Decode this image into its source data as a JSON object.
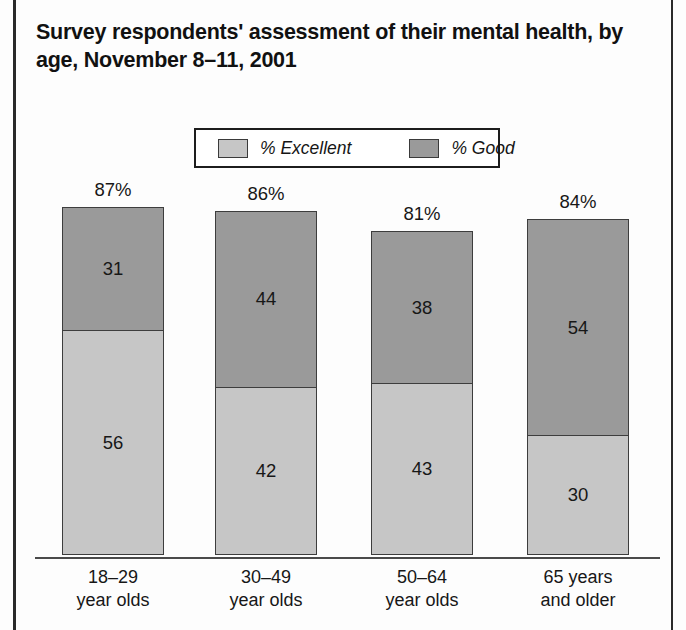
{
  "figure": {
    "title": "Survey respondents' assessment of their mental health, by age, November 8–11, 2001"
  },
  "legend": {
    "position": "top-center",
    "entries": [
      {
        "label": "% Excellent",
        "color": "#c6c6c6",
        "swatch_name": "legend-swatch-excellent"
      },
      {
        "label": "% Good",
        "color": "#9a9a9a",
        "swatch_name": "legend-swatch-good"
      }
    ]
  },
  "chart_data": {
    "type": "bar",
    "subtype": "stacked-vertical",
    "title": "Survey respondents' assessment of their mental health, by age, November 8–11, 2001",
    "xlabel": "",
    "ylabel": "",
    "ylim": [
      0,
      100
    ],
    "grid": false,
    "legend_position": "top-center",
    "categories": [
      "18–29\nyear olds",
      "30–49\nyear olds",
      "50–64\nyear olds",
      "65 years\nand older"
    ],
    "category_lines": [
      [
        "18–29",
        "year olds"
      ],
      [
        "30–49",
        "year olds"
      ],
      [
        "50–64",
        "year olds"
      ],
      [
        "65 years",
        "and older"
      ]
    ],
    "series": [
      {
        "name": "% Excellent",
        "color": "#c6c6c6",
        "values": [
          56,
          42,
          43,
          30
        ]
      },
      {
        "name": "% Good",
        "color": "#9a9a9a",
        "values": [
          31,
          44,
          38,
          54
        ]
      }
    ],
    "totals": [
      87,
      86,
      81,
      84
    ],
    "total_labels": [
      "87%",
      "86%",
      "81%",
      "84%"
    ],
    "value_labels": {
      "excellent": [
        "56",
        "42",
        "43",
        "30"
      ],
      "good": [
        "31",
        "44",
        "38",
        "54"
      ]
    }
  }
}
